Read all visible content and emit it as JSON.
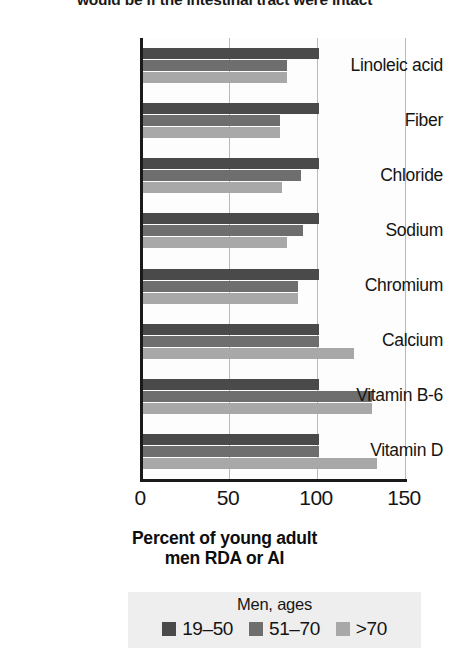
{
  "caption": "would be if the intestinal tract were intact",
  "chart_data": {
    "type": "bar",
    "orientation": "horizontal",
    "title": "",
    "xlabel": "Percent of young adult men RDA or AI",
    "xlabel_line1": "Percent of young adult",
    "xlabel_line2": "men RDA or AI",
    "ylabel": "",
    "xlim": [
      0,
      150
    ],
    "xticks": [
      "0",
      "50",
      "100",
      "150"
    ],
    "xtick_values": [
      0,
      50,
      100,
      150
    ],
    "grid": "vertical",
    "legend_position": "below",
    "legend_title": "Men, ages",
    "categories": [
      "Linoleic acid",
      "Fiber",
      "Chloride",
      "Sodium",
      "Chromium",
      "Calcium",
      "Vitamin B-6",
      "Vitamin D"
    ],
    "series": [
      {
        "name": "19–50",
        "color": "#4a4a4a",
        "values": [
          100,
          100,
          100,
          100,
          100,
          100,
          100,
          100
        ]
      },
      {
        "name": "51–70",
        "color": "#6e6e6e",
        "values": [
          82,
          78,
          90,
          91,
          88,
          100,
          130,
          100
        ]
      },
      {
        "name": ">70",
        "color": "#a8a8a8",
        "values": [
          82,
          78,
          79,
          82,
          88,
          120,
          130,
          133
        ]
      }
    ]
  },
  "colors": {
    "series_19_50": "#4a4a4a",
    "series_51_70": "#6e6e6e",
    "series_over_70": "#a8a8a8",
    "axis": "#1a1a1a",
    "grid": "#b9b9b9",
    "legend_background": "#eeeeee"
  }
}
